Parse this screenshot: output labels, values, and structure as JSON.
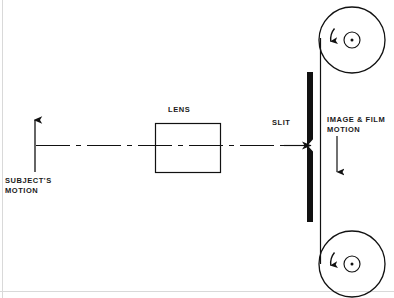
{
  "diagram": {
    "canvas": {
      "width": 394,
      "height": 298,
      "background": "#ffffff"
    },
    "ink_color": "#111111",
    "labels": {
      "subject_motion": "SUBJECT'S\nMOTION",
      "lens": "LENS",
      "slit": "SLIT",
      "image_film_motion": "IMAGE & FILM\nMOTION"
    },
    "components": [
      {
        "name": "subject-motion-arrow",
        "kind": "arrow",
        "direction": "up",
        "x": 35,
        "y_from": 172,
        "y_to": 117
      },
      {
        "name": "optical-axis",
        "kind": "center-line",
        "style": "long-dash-short-dash",
        "x_from": 36,
        "x_to": 312,
        "y": 145,
        "arrowhead": "right"
      },
      {
        "name": "lens-rectangle",
        "kind": "rectangle",
        "x": 155,
        "y": 123,
        "width": 65,
        "height": 49
      },
      {
        "name": "slit-bar",
        "kind": "filled-bar",
        "x": 307,
        "y_from": 72,
        "y_to": 222,
        "width": 6,
        "gap_y": 145,
        "gap_shape": "v-notch"
      },
      {
        "name": "film-strip",
        "kind": "line",
        "x": 320,
        "y_from": 40,
        "y_to": 262
      },
      {
        "name": "image-film-motion-arrow",
        "kind": "arrow",
        "direction": "down",
        "x": 337,
        "y_from": 136,
        "y_to": 175
      },
      {
        "name": "upper-reel",
        "kind": "reel",
        "cx": 352,
        "cy": 40,
        "radius": 33,
        "hub_radius": 8,
        "rotation": "counter-clockwise"
      },
      {
        "name": "lower-reel",
        "kind": "reel",
        "cx": 352,
        "cy": 264,
        "radius": 33,
        "hub_radius": 8,
        "rotation": "counter-clockwise"
      }
    ]
  }
}
